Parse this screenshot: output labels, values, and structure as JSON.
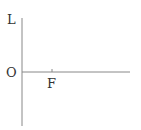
{
  "diagram": {
    "type": "axes",
    "labels": {
      "vertical_axis": "L",
      "origin": "O",
      "tick": "F"
    },
    "colors": {
      "axis": "#888888",
      "text": "#333333",
      "background": "#ffffff"
    }
  }
}
